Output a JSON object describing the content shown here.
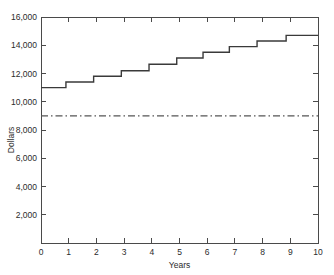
{
  "chart_data": {
    "type": "line",
    "subtype": "step-post",
    "title": "",
    "xlabel": "Years",
    "ylabel": "Dollars",
    "xlim": [
      0,
      10
    ],
    "ylim": [
      0,
      16000
    ],
    "grid": false,
    "legend": "none",
    "x_ticks": [
      0,
      1,
      2,
      3,
      4,
      5,
      6,
      7,
      8,
      9,
      10
    ],
    "x_tick_labels": [
      "0",
      "1",
      "2",
      "3",
      "4",
      "5",
      "6",
      "7",
      "8",
      "9",
      "10"
    ],
    "y_ticks": [
      2000,
      4000,
      6000,
      8000,
      10000,
      12000,
      14000,
      16000
    ],
    "y_tick_labels": [
      "2,000",
      "4,000",
      "6,000",
      "8,000",
      "10,000",
      "12,000",
      "14,000",
      "16,000"
    ],
    "ticks_direction": "in",
    "frame": [
      "left",
      "right",
      "top",
      "bottom"
    ],
    "series": [
      {
        "name": "accumulated-value",
        "style": "solid-step",
        "color": "#3a3a3a",
        "x": [
          0,
          0.9,
          0.9,
          1.9,
          1.9,
          2.9,
          2.9,
          3.9,
          3.9,
          4.9,
          4.9,
          5.85,
          5.85,
          6.8,
          6.8,
          7.8,
          7.8,
          8.85,
          8.85,
          10
        ],
        "y": [
          11000,
          11000,
          11400,
          11400,
          11800,
          11800,
          12200,
          12200,
          12650,
          12650,
          13100,
          13100,
          13500,
          13500,
          13900,
          13900,
          14300,
          14300,
          14700,
          14700
        ],
        "step_levels": [
          11000,
          11400,
          11800,
          12200,
          12650,
          13100,
          13500,
          13900,
          14300,
          14700
        ],
        "step_edges": [
          0.9,
          1.9,
          2.9,
          3.9,
          4.9,
          5.85,
          6.8,
          7.8,
          8.85
        ]
      },
      {
        "name": "reference-level",
        "style": "dash-dot",
        "color": "#555555",
        "value": 9000,
        "x": [
          0,
          10
        ],
        "y": [
          9000,
          9000
        ]
      }
    ]
  },
  "axes": {
    "y_title": "Dollars",
    "x_title": "Years"
  }
}
